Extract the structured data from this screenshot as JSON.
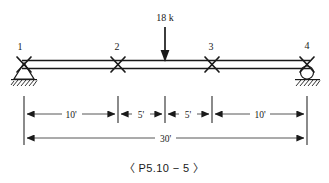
{
  "figure": {
    "caption": "〈 P5.10 − 5 〉"
  },
  "load": {
    "label": "18 k",
    "magnitude": 18,
    "unit": "k",
    "direction": "down",
    "position_ft": 15
  },
  "joints": [
    {
      "id": "1",
      "label": "1",
      "type": "pin-support",
      "x_ft": 0
    },
    {
      "id": "2",
      "label": "2",
      "type": "internal-hinge",
      "x_ft": 10
    },
    {
      "id": "3",
      "label": "3",
      "type": "internal-hinge",
      "x_ft": 20
    },
    {
      "id": "4",
      "label": "4",
      "type": "roller-support",
      "x_ft": 30
    }
  ],
  "supports": {
    "left": {
      "type": "pin",
      "icon": "pin-support-icon",
      "label": "1"
    },
    "right": {
      "type": "roller",
      "icon": "roller-support-icon",
      "label": "4"
    }
  },
  "dimensions": {
    "segments": [
      {
        "label": "10'",
        "value_ft": 10,
        "from_ft": 0,
        "to_ft": 10
      },
      {
        "label": "5'",
        "value_ft": 5,
        "from_ft": 10,
        "to_ft": 15
      },
      {
        "label": "5'",
        "value_ft": 5,
        "from_ft": 15,
        "to_ft": 20
      },
      {
        "label": "10'",
        "value_ft": 10,
        "from_ft": 20,
        "to_ft": 30
      }
    ],
    "total": {
      "label": "30'",
      "value_ft": 30,
      "from_ft": 0,
      "to_ft": 30
    }
  },
  "colors": {
    "ink": "#1a1a1a",
    "thin_ink": "#2b2b2b",
    "background": "#ffffff"
  }
}
